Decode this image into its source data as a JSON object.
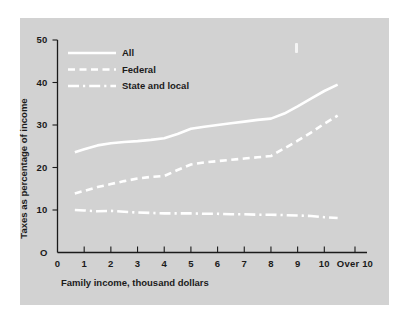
{
  "figure": {
    "background_color": "#ffffff",
    "panel_color": "#d2d2d2",
    "ink_color": "#ffffff",
    "text_color": "#1b1b1b"
  },
  "chart_data": {
    "type": "line",
    "title": "",
    "xlabel": "Family income, thousand dollars",
    "ylabel": "Taxes as percentage of income",
    "xlim": [
      0,
      11.6
    ],
    "ylim": [
      0,
      50
    ],
    "grid": false,
    "legend_position": "top-left",
    "x_tick_labels": [
      "0",
      "1",
      "2",
      "3",
      "4",
      "5",
      "6",
      "7",
      "8",
      "9",
      "10",
      "Over 10"
    ],
    "x_tick_values": [
      0,
      1,
      2,
      3,
      4,
      5,
      6,
      7,
      8,
      9,
      10,
      11.15
    ],
    "y_tick_labels": [
      "O",
      "10",
      "20",
      "30",
      "40",
      "50"
    ],
    "y_tick_values": [
      0,
      10,
      20,
      30,
      40,
      50
    ],
    "x": [
      0.65,
      1.0,
      1.5,
      2.0,
      2.5,
      3.0,
      3.5,
      4.0,
      4.5,
      5.0,
      5.5,
      6.0,
      6.5,
      7.0,
      7.5,
      8.0,
      8.5,
      9.0,
      9.5,
      10.0,
      10.5
    ],
    "series": [
      {
        "name": "All",
        "style": "solid",
        "values": [
          23.6,
          24.3,
          25.2,
          25.7,
          26.0,
          26.2,
          26.5,
          26.9,
          27.9,
          29.1,
          29.6,
          30.0,
          30.4,
          30.8,
          31.2,
          31.5,
          32.7,
          34.4,
          36.2,
          38.0,
          39.5
        ]
      },
      {
        "name": "Federal",
        "style": "dashed",
        "values": [
          13.9,
          14.5,
          15.4,
          16.1,
          16.8,
          17.4,
          17.8,
          18.0,
          19.4,
          20.7,
          21.2,
          21.5,
          21.8,
          22.1,
          22.4,
          22.7,
          24.5,
          26.3,
          28.2,
          30.3,
          32.2
        ]
      },
      {
        "name": "State and local",
        "style": "dashdot",
        "values": [
          10.0,
          9.9,
          9.7,
          9.8,
          9.6,
          9.4,
          9.3,
          9.2,
          9.2,
          9.2,
          9.1,
          9.1,
          9.0,
          9.0,
          8.9,
          8.9,
          8.8,
          8.7,
          8.6,
          8.3,
          8.1
        ]
      }
    ]
  },
  "legend": {
    "items": [
      {
        "label": "All",
        "style": "solid"
      },
      {
        "label": "Federal",
        "style": "dashed"
      },
      {
        "label": "State and local",
        "style": "dashdot"
      }
    ]
  }
}
